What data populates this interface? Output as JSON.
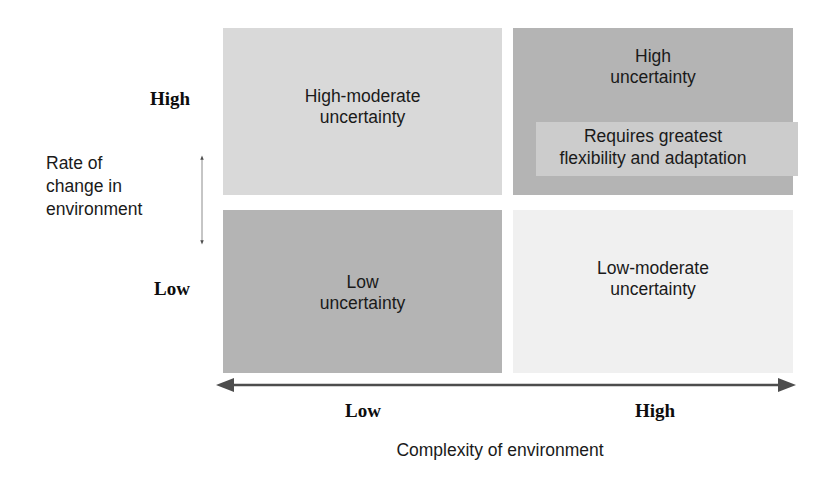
{
  "diagram": {
    "y_axis": {
      "title": "Rate of\nchange in\nenvironment",
      "high_label": "High",
      "low_label": "Low",
      "arrow": "double-headed-vertical-arrow"
    },
    "x_axis": {
      "title": "Complexity of environment",
      "low_label": "Low",
      "high_label": "High",
      "arrow": "double-headed-horizontal-arrow"
    },
    "quadrants": [
      {
        "id": "high-change-low-complexity",
        "position": "top-left",
        "label": "High-moderate\nuncertainty",
        "fill": "#d9d9d9"
      },
      {
        "id": "high-change-high-complexity",
        "position": "top-right",
        "label": "High\nuncertainty",
        "note": "Requires greatest\nflexibility and adaptation",
        "fill": "#b4b4b4",
        "note_fill": "#cccccc"
      },
      {
        "id": "low-change-low-complexity",
        "position": "bottom-left",
        "label": "Low\nuncertainty",
        "fill": "#b4b4b4"
      },
      {
        "id": "low-change-high-complexity",
        "position": "bottom-right",
        "label": "Low-moderate\nuncertainty",
        "fill": "#f0f0f0"
      }
    ],
    "colors": {
      "axis_line": "#4d4d4d",
      "text": "#1a1a1a",
      "background": "#ffffff"
    }
  }
}
